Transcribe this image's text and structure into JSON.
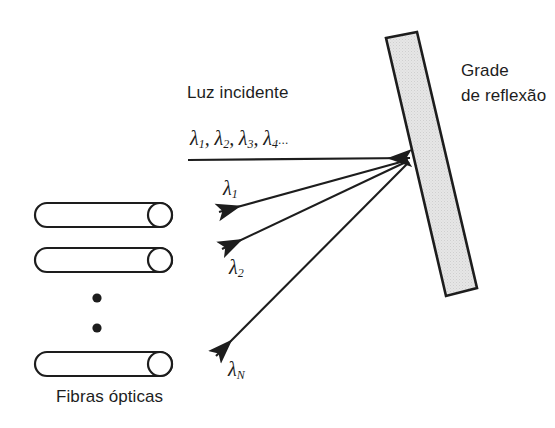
{
  "figure": {
    "background_color": "#ffffff",
    "line_color": "#1d1d1d",
    "grating_fill": "#e3e3e3"
  },
  "captions": {
    "incident_light": "Luz incidente",
    "grating": {
      "line1": "Grade",
      "line2": "de reflexão"
    },
    "fibers": "Fibras ópticas"
  },
  "incident_beam": {
    "lambda_symbol": "λ",
    "items": [
      {
        "symbol": "λ",
        "sub": "1",
        "sep": ", "
      },
      {
        "symbol": "λ",
        "sub": "2",
        "sep": ", "
      },
      {
        "symbol": "λ",
        "sub": "3",
        "sep": ", "
      },
      {
        "symbol": "λ",
        "sub": "4",
        "sep": " "
      }
    ],
    "ellipsis": "...",
    "full_text": "λ1, λ2, λ3, λ4 ..."
  },
  "diffracted_rays": [
    {
      "name": "lambda-1",
      "symbol": "λ",
      "sub": "1"
    },
    {
      "name": "lambda-2",
      "symbol": "λ",
      "sub": "2"
    },
    {
      "name": "lambda-N",
      "symbol": "λ",
      "sub": "N"
    }
  ],
  "fibers": {
    "count_drawn": 3,
    "vertical_dots": 2,
    "items": [
      {
        "name": "optical-fiber-1"
      },
      {
        "name": "optical-fiber-2"
      },
      {
        "name": "optical-fiber-n"
      }
    ]
  }
}
